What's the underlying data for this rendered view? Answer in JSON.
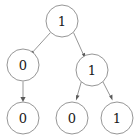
{
  "diagram": {
    "type": "binary-tree",
    "title": "",
    "background_color": "#ffffff",
    "node_stroke_color": "#8a8a8a",
    "edge_color": "#8a8a8a",
    "arrow_color": "#5a5a5a",
    "label_color": "#1a1a1a",
    "node_radius": 16,
    "nodes": [
      {
        "id": "root",
        "label": "1",
        "cx": 62,
        "cy": 21,
        "level": 0
      },
      {
        "id": "left",
        "label": "0",
        "cx": 23,
        "cy": 65,
        "level": 1
      },
      {
        "id": "right",
        "label": "1",
        "cx": 92,
        "cy": 70,
        "level": 1
      },
      {
        "id": "left-child",
        "label": "0",
        "cx": 23,
        "cy": 118,
        "level": 2
      },
      {
        "id": "right-left",
        "label": "0",
        "cx": 72,
        "cy": 118,
        "level": 2
      },
      {
        "id": "right-right",
        "label": "1",
        "cx": 117,
        "cy": 118,
        "level": 2
      }
    ],
    "edges": [
      {
        "id": "edge-root-left",
        "from": "root",
        "to": "left",
        "directed": true
      },
      {
        "id": "edge-root-right",
        "from": "root",
        "to": "right",
        "directed": true
      },
      {
        "id": "edge-left-child",
        "from": "left",
        "to": "left-child",
        "directed": true
      },
      {
        "id": "edge-right-left",
        "from": "right",
        "to": "right-left",
        "directed": true
      },
      {
        "id": "edge-right-right",
        "from": "right",
        "to": "right-right",
        "directed": true
      }
    ]
  }
}
